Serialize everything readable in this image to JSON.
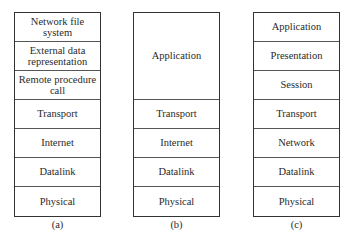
{
  "stacks": {
    "a": {
      "caption": "(a)",
      "layers": [
        "Network file system",
        "External data representation",
        "Remote procedure call",
        "Transport",
        "Internet",
        "Datalink",
        "Physical"
      ]
    },
    "b": {
      "caption": "(b)",
      "layers": [
        "Application",
        "Transport",
        "Internet",
        "Datalink",
        "Physical"
      ]
    },
    "c": {
      "caption": "(c)",
      "layers": [
        "Application",
        "Presentation",
        "Session",
        "Transport",
        "Network",
        "Datalink",
        "Physical"
      ]
    }
  }
}
